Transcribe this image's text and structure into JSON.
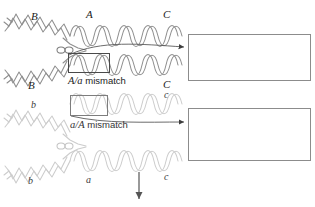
{
  "figure": {
    "width": 315,
    "height": 207
  },
  "colors": {
    "strand_dark": "#7a7a7a",
    "strand_light": "#c0c0c0",
    "helix_backbone": "#4a4a4a",
    "helix_rung": "#9a9a9a",
    "box_border": "#8c8c8c",
    "mismatch_border": "#4a4a4a",
    "text": "#1a1a1a",
    "arrow": "#555555"
  },
  "upper_duplex": {
    "left_arm_top_label": "B",
    "left_arm_bottom_label": "B",
    "top_strand_label": "A",
    "top_right_label": "C",
    "bottom_right_label": "C",
    "mismatch_caption_prefix": "A/a",
    "mismatch_caption_suffix": " mismatch"
  },
  "lower_duplex": {
    "left_arm_top_label": "b",
    "left_arm_bottom_label": "b",
    "bottom_strand_label": "a",
    "top_right_label": "c",
    "bottom_right_label": "c",
    "mismatch_caption_prefix": "a/A",
    "mismatch_caption_suffix": " mismatch"
  },
  "insets": {
    "upper": {
      "name": "dna-double-helix-upper",
      "turns": 3,
      "description": "DNA double helix with mismatched base pair"
    },
    "lower": {
      "name": "dna-double-helix-lower",
      "turns": 3,
      "description": "DNA double helix with mismatched base pair"
    }
  },
  "arrows": {
    "upper_leader": "leader line from A/a mismatch to upper helix inset",
    "lower_leader": "leader line from a/A mismatch to lower helix inset",
    "process": "downward process arrow"
  }
}
